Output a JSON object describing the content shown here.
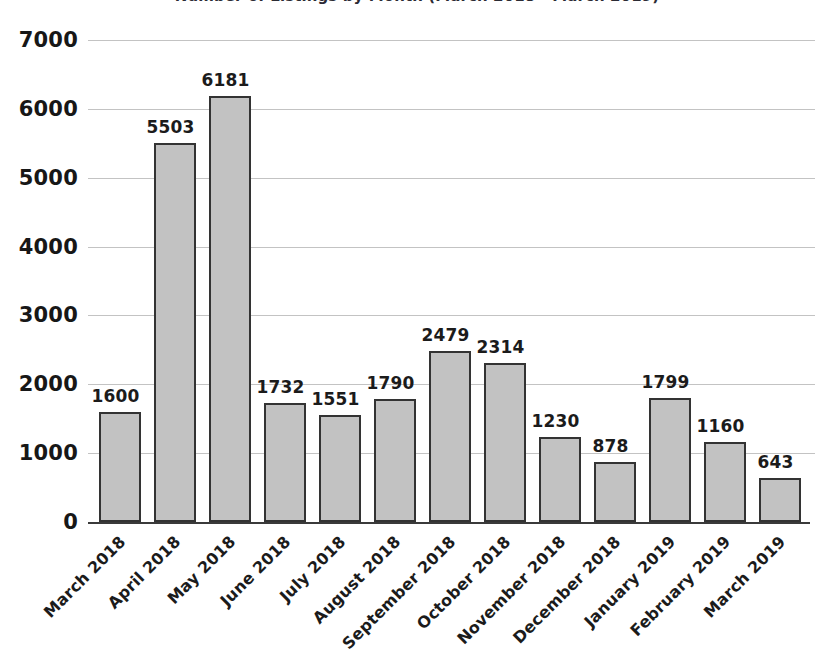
{
  "chart_data": {
    "type": "bar",
    "title": "Number of Listings by Month (March 2018 - March 2019)",
    "xlabel": "",
    "ylabel": "",
    "ylim": [
      0,
      7000
    ],
    "ytick_step": 1000,
    "yticks": [
      "7000",
      "6000",
      "5000",
      "4000",
      "3000",
      "2000",
      "1000",
      "0"
    ],
    "grid": true,
    "legend": "none",
    "bar_fill_color": "#c2c2c2",
    "bar_border_color": "#333333",
    "gridline_color": "#b9b9b9",
    "axis_color": "#3a3a3a",
    "show_value_labels": true,
    "categories": [
      "March 2018",
      "April 2018",
      "May 2018",
      "June 2018",
      "July 2018",
      "August 2018",
      "September 2018",
      "October 2018",
      "November 2018",
      "December 2018",
      "January 2019",
      "February 2019",
      "March 2019"
    ],
    "values": [
      1600,
      5503,
      6181,
      1732,
      1551,
      1790,
      2479,
      2314,
      1230,
      878,
      1799,
      1160,
      643
    ],
    "value_labels": [
      "1600",
      "5503",
      "6181",
      "1732",
      "1551",
      "1790",
      "2479",
      "2314",
      "1230",
      "878",
      "1799",
      "1160",
      "643"
    ]
  }
}
